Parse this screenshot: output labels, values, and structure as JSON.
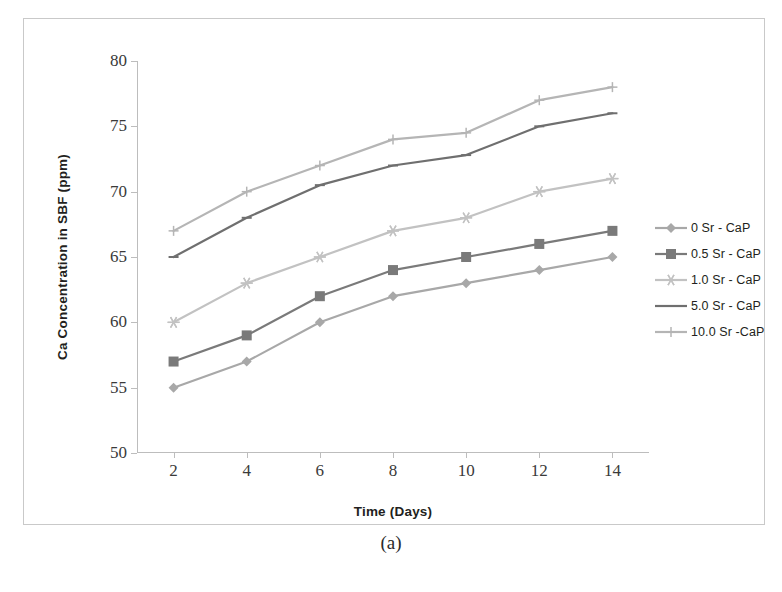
{
  "figure": {
    "caption": "(a)"
  },
  "chart_data": {
    "type": "line",
    "title": "",
    "xlabel": "Time (Days)",
    "ylabel": "Ca Concentration in SBF (ppm)",
    "x": [
      2,
      4,
      6,
      8,
      10,
      12,
      14
    ],
    "xticklabels": [
      "2",
      "4",
      "6",
      "8",
      "10",
      "12",
      "14"
    ],
    "yticklabels": [
      "50",
      "55",
      "60",
      "65",
      "70",
      "75",
      "80"
    ],
    "yticks": [
      50,
      55,
      60,
      65,
      70,
      75,
      80
    ],
    "xlim": [
      1,
      15
    ],
    "ylim": [
      50,
      80
    ],
    "grid": false,
    "legend_position": "right",
    "series": [
      {
        "name": "0 Sr - CaP",
        "marker": "diamond",
        "color": "#a8a8a8",
        "values": [
          55,
          57,
          60,
          62,
          63,
          64,
          65
        ]
      },
      {
        "name": "0.5 Sr - CaP",
        "marker": "square",
        "color": "#7a7a7a",
        "values": [
          57,
          59,
          62,
          64,
          65,
          66,
          67
        ]
      },
      {
        "name": "1.0 Sr - CaP",
        "marker": "star",
        "color": "#c2c2c2",
        "values": [
          60,
          63,
          65,
          67,
          68,
          70,
          71
        ]
      },
      {
        "name": "5.0 Sr - CaP",
        "marker": "dash",
        "color": "#6f6f6f",
        "values": [
          65,
          68,
          70.5,
          72,
          72.8,
          75,
          76
        ]
      },
      {
        "name": "10.0 Sr -CaP",
        "marker": "plus",
        "color": "#b5b5b5",
        "values": [
          67,
          70,
          72,
          74,
          74.5,
          77,
          78
        ]
      }
    ]
  }
}
